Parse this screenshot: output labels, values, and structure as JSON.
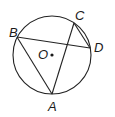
{
  "diagram": {
    "type": "circle-geometry",
    "circle": {
      "center_label": "O",
      "cx": 52,
      "cy": 55,
      "r": 39
    },
    "points": [
      {
        "label": "A",
        "x": 52,
        "y": 94,
        "label_x": 48,
        "label_y": 111
      },
      {
        "label": "B",
        "x": 17,
        "y": 37,
        "label_x": 9,
        "label_y": 37
      },
      {
        "label": "C",
        "x": 74,
        "y": 23,
        "label_x": 75,
        "label_y": 20
      },
      {
        "label": "D",
        "x": 90,
        "y": 48,
        "label_x": 94,
        "label_y": 52
      }
    ],
    "center": {
      "label": "O",
      "dot_x": 52,
      "dot_y": 55,
      "label_x": 38,
      "label_y": 59
    },
    "segments": [
      {
        "from": "B",
        "to": "D"
      },
      {
        "from": "B",
        "to": "A"
      },
      {
        "from": "A",
        "to": "C"
      },
      {
        "from": "C",
        "to": "D"
      }
    ],
    "colors": {
      "line": "#222222",
      "text": "#1a1a1a",
      "background": "#ffffff"
    }
  }
}
